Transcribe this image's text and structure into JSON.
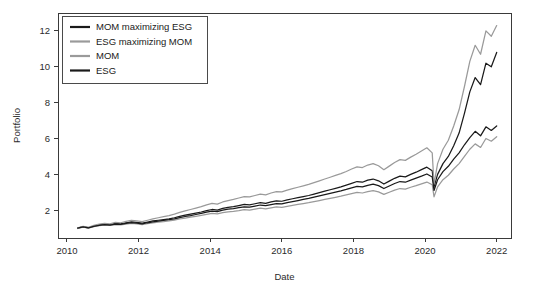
{
  "chart_data": {
    "type": "line",
    "title": "",
    "xlabel": "Date",
    "ylabel": "Portfolio",
    "xlim": [
      2009.75,
      2022.4
    ],
    "ylim": [
      0.45,
      13.0
    ],
    "xticks": [
      2010,
      2012,
      2014,
      2016,
      2018,
      2020,
      2022
    ],
    "xtick_labels": [
      "2010",
      "2012",
      "2014",
      "2016",
      "2018",
      "2020",
      "2022"
    ],
    "yticks": [
      2,
      4,
      6,
      8,
      10,
      12
    ],
    "ytick_labels": [
      "2",
      "4",
      "6",
      "8",
      "10",
      "12"
    ],
    "grid": false,
    "legend_position": "top-left",
    "legend": [
      {
        "label": "MOM maximizing ESG",
        "color": "#1a1a1a"
      },
      {
        "label": "ESG maximizing MOM",
        "color": "#9a9a9a"
      },
      {
        "label": "MOM",
        "color": "#9a9a9a"
      },
      {
        "label": "ESG",
        "color": "#1a1a1a"
      }
    ],
    "x": [
      2010.3,
      2010.45,
      2010.6,
      2010.75,
      2010.9,
      2011.05,
      2011.2,
      2011.35,
      2011.5,
      2011.65,
      2011.8,
      2011.95,
      2012.1,
      2012.25,
      2012.4,
      2012.55,
      2012.7,
      2012.85,
      2013.0,
      2013.15,
      2013.3,
      2013.45,
      2013.6,
      2013.75,
      2013.9,
      2014.05,
      2014.2,
      2014.35,
      2014.5,
      2014.65,
      2014.8,
      2014.95,
      2015.1,
      2015.25,
      2015.4,
      2015.55,
      2015.7,
      2015.85,
      2016.0,
      2016.15,
      2016.3,
      2016.45,
      2016.6,
      2016.75,
      2016.9,
      2017.05,
      2017.2,
      2017.35,
      2017.5,
      2017.65,
      2017.8,
      2017.95,
      2018.1,
      2018.25,
      2018.4,
      2018.55,
      2018.7,
      2018.85,
      2019.0,
      2019.15,
      2019.3,
      2019.45,
      2019.6,
      2019.75,
      2019.9,
      2020.05,
      2020.2,
      2020.25,
      2020.35,
      2020.5,
      2020.65,
      2020.8,
      2020.95,
      2021.1,
      2021.25,
      2021.4,
      2021.55,
      2021.7,
      2021.85,
      2022.0
    ],
    "series": [
      {
        "name": "MOM maximizing ESG",
        "color": "#1a1a1a",
        "values": [
          1.0,
          1.08,
          1.02,
          1.12,
          1.18,
          1.22,
          1.2,
          1.26,
          1.24,
          1.3,
          1.35,
          1.32,
          1.28,
          1.34,
          1.4,
          1.44,
          1.48,
          1.52,
          1.58,
          1.66,
          1.72,
          1.78,
          1.84,
          1.9,
          1.98,
          2.04,
          2.0,
          2.1,
          2.16,
          2.2,
          2.26,
          2.32,
          2.3,
          2.36,
          2.42,
          2.38,
          2.46,
          2.52,
          2.5,
          2.58,
          2.64,
          2.7,
          2.76,
          2.82,
          2.9,
          2.98,
          3.06,
          3.14,
          3.22,
          3.3,
          3.4,
          3.5,
          3.6,
          3.56,
          3.68,
          3.74,
          3.64,
          3.46,
          3.62,
          3.78,
          3.9,
          3.86,
          4.0,
          4.12,
          4.26,
          4.4,
          4.2,
          3.3,
          4.0,
          4.6,
          5.0,
          5.6,
          6.3,
          7.4,
          8.6,
          9.4,
          9.0,
          10.2,
          10.0,
          10.8
        ]
      },
      {
        "name": "ESG maximizing MOM",
        "color": "#9a9a9a",
        "values": [
          1.02,
          1.1,
          1.05,
          1.16,
          1.22,
          1.26,
          1.24,
          1.32,
          1.3,
          1.38,
          1.44,
          1.4,
          1.36,
          1.44,
          1.52,
          1.58,
          1.64,
          1.7,
          1.78,
          1.88,
          1.96,
          2.04,
          2.12,
          2.2,
          2.3,
          2.38,
          2.34,
          2.46,
          2.54,
          2.6,
          2.68,
          2.76,
          2.74,
          2.82,
          2.9,
          2.86,
          2.96,
          3.04,
          3.02,
          3.12,
          3.2,
          3.28,
          3.36,
          3.44,
          3.54,
          3.64,
          3.74,
          3.84,
          3.94,
          4.04,
          4.16,
          4.3,
          4.42,
          4.38,
          4.52,
          4.6,
          4.48,
          4.26,
          4.46,
          4.66,
          4.82,
          4.78,
          4.96,
          5.12,
          5.3,
          5.48,
          5.2,
          3.45,
          4.6,
          5.4,
          5.9,
          6.7,
          7.6,
          8.9,
          10.3,
          11.2,
          10.7,
          12.0,
          11.7,
          12.3
        ]
      },
      {
        "name": "MOM",
        "color": "#9a9a9a",
        "values": [
          0.98,
          1.05,
          1.0,
          1.08,
          1.14,
          1.17,
          1.15,
          1.2,
          1.18,
          1.23,
          1.27,
          1.24,
          1.2,
          1.25,
          1.3,
          1.33,
          1.36,
          1.4,
          1.45,
          1.51,
          1.56,
          1.61,
          1.66,
          1.71,
          1.77,
          1.82,
          1.79,
          1.86,
          1.91,
          1.94,
          1.98,
          2.03,
          2.01,
          2.06,
          2.11,
          2.08,
          2.13,
          2.18,
          2.16,
          2.22,
          2.27,
          2.32,
          2.37,
          2.42,
          2.48,
          2.54,
          2.6,
          2.66,
          2.72,
          2.78,
          2.85,
          2.92,
          2.99,
          2.96,
          3.04,
          3.09,
          3.02,
          2.88,
          3.0,
          3.12,
          3.21,
          3.18,
          3.28,
          3.37,
          3.47,
          3.57,
          3.42,
          2.75,
          3.3,
          3.7,
          3.95,
          4.3,
          4.6,
          5.0,
          5.4,
          5.7,
          5.5,
          6.0,
          5.85,
          6.1
        ]
      },
      {
        "name": "ESG",
        "color": "#1a1a1a",
        "values": [
          1.0,
          1.07,
          1.01,
          1.1,
          1.16,
          1.19,
          1.17,
          1.23,
          1.21,
          1.26,
          1.31,
          1.28,
          1.24,
          1.3,
          1.35,
          1.39,
          1.43,
          1.47,
          1.52,
          1.59,
          1.65,
          1.7,
          1.76,
          1.82,
          1.89,
          1.95,
          1.92,
          2.0,
          2.06,
          2.09,
          2.14,
          2.19,
          2.17,
          2.23,
          2.29,
          2.25,
          2.31,
          2.37,
          2.35,
          2.42,
          2.48,
          2.54,
          2.6,
          2.66,
          2.73,
          2.8,
          2.87,
          2.94,
          3.01,
          3.08,
          3.16,
          3.25,
          3.33,
          3.3,
          3.39,
          3.45,
          3.37,
          3.21,
          3.35,
          3.49,
          3.6,
          3.56,
          3.68,
          3.79,
          3.9,
          4.02,
          3.85,
          3.1,
          3.7,
          4.15,
          4.45,
          4.85,
          5.2,
          5.65,
          6.05,
          6.4,
          6.15,
          6.65,
          6.45,
          6.7
        ]
      }
    ]
  }
}
